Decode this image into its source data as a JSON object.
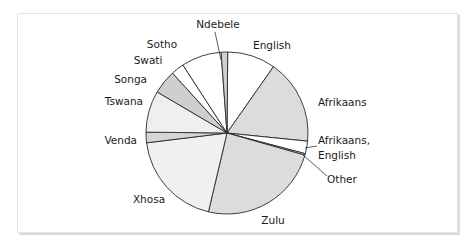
{
  "chart_data": {
    "type": "pie",
    "title": "",
    "start_angle_deg": 0,
    "direction": "clockwise",
    "categories": [
      "English",
      "Afrikaans",
      "Afrikaans, English",
      "Other",
      "Zulu",
      "Xhosa",
      "Venda",
      "Tswana",
      "Songa",
      "Swati",
      "Sotho",
      "Ndebele"
    ],
    "values": [
      9.6,
      16.9,
      2.5,
      0.3,
      24.3,
      19.4,
      2.1,
      8.3,
      4.8,
      2.6,
      8.0,
      1.3
    ],
    "unit": "percent (estimated from slice angles)",
    "colors": [
      "#ffffff",
      "#dcdcdc",
      "#ffffff",
      "#ffffff",
      "#dcdcdc",
      "#f0f0f0",
      "#d6d6d6",
      "#efefef",
      "#cfcfcf",
      "#ffffff",
      "#ffffff",
      "#cfcfcf"
    ],
    "legend": "none (direct labels)",
    "labels": [
      {
        "text": "English",
        "x": 272,
        "y": 49,
        "anchor": "middle"
      },
      {
        "text": "Afrikaans",
        "x": 318,
        "y": 106,
        "anchor": "start"
      },
      {
        "text": "Afrikaans,",
        "x": 318,
        "y": 144,
        "anchor": "start"
      },
      {
        "text": "English",
        "x": 318,
        "y": 159,
        "anchor": "start"
      },
      {
        "text": "Other",
        "x": 327,
        "y": 183,
        "anchor": "start"
      },
      {
        "text": "Zulu",
        "x": 273,
        "y": 224,
        "anchor": "middle"
      },
      {
        "text": "Xhosa",
        "x": 149,
        "y": 203,
        "anchor": "middle"
      },
      {
        "text": "Venda",
        "x": 137,
        "y": 144,
        "anchor": "end"
      },
      {
        "text": "Tswana",
        "x": 143,
        "y": 105,
        "anchor": "end"
      },
      {
        "text": "Songa",
        "x": 147,
        "y": 83,
        "anchor": "end"
      },
      {
        "text": "Swati",
        "x": 148,
        "y": 64,
        "anchor": "middle"
      },
      {
        "text": "Sotho",
        "x": 162,
        "y": 48,
        "anchor": "middle"
      },
      {
        "text": "Ndebele",
        "x": 218,
        "y": 28,
        "anchor": "middle"
      }
    ]
  },
  "geometry": {
    "cx": 227,
    "cy": 133,
    "r": 81
  }
}
